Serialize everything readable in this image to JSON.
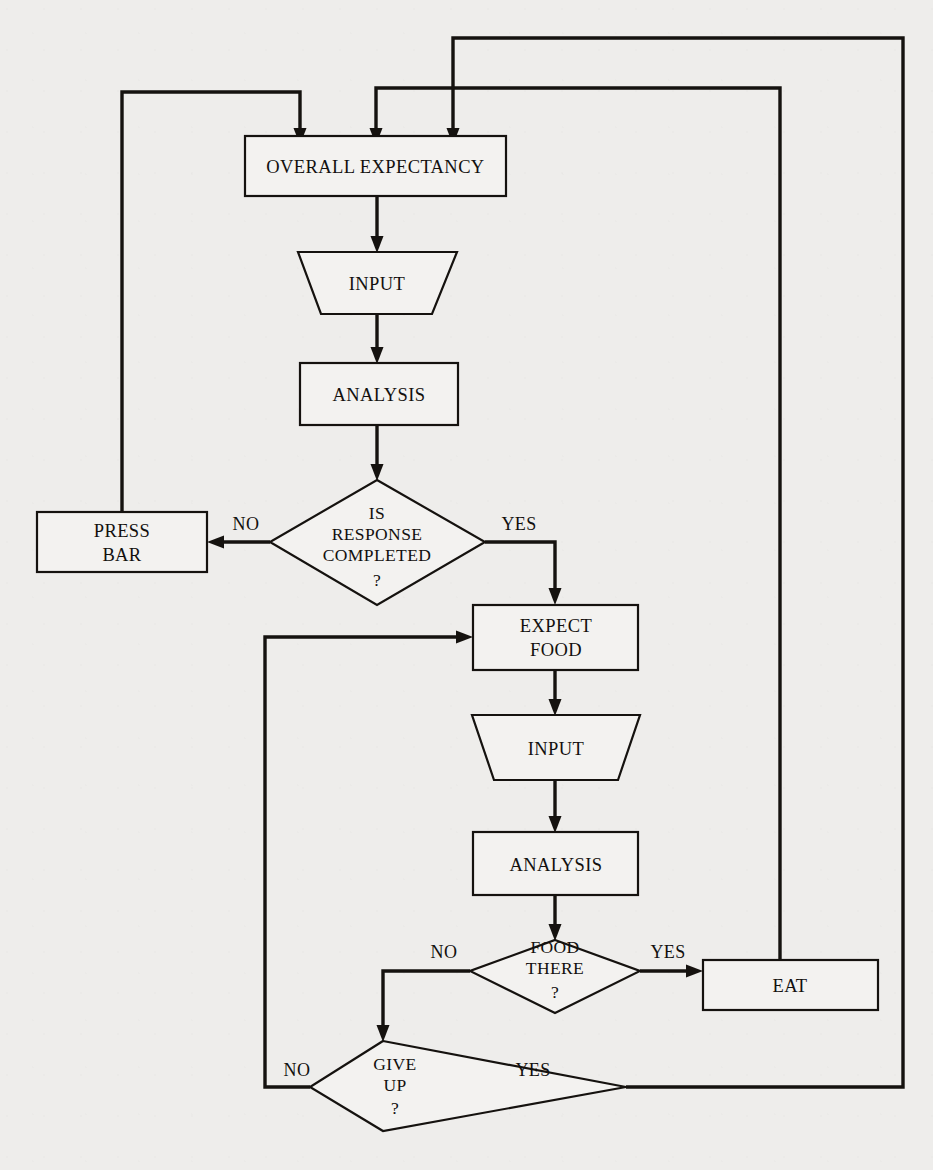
{
  "diagram": {
    "type": "flowchart",
    "background_color": "#eeedeb",
    "ink_color": "#15120f",
    "nodes": [
      {
        "id": "overall_expectancy",
        "shape": "rectangle",
        "label": "OVERALL EXPECTANCY"
      },
      {
        "id": "input_1",
        "shape": "trapezoid",
        "label": "INPUT"
      },
      {
        "id": "analysis_1",
        "shape": "rectangle",
        "label": "ANALYSIS"
      },
      {
        "id": "is_response_completed",
        "shape": "diamond",
        "label_line1": "IS",
        "label_line2": "RESPONSE",
        "label_line3": "COMPLETED",
        "label_line4": "?"
      },
      {
        "id": "press_bar",
        "shape": "rectangle",
        "label_line1": "PRESS",
        "label_line2": "BAR"
      },
      {
        "id": "expect_food",
        "shape": "rectangle",
        "label_line1": "EXPECT",
        "label_line2": "FOOD"
      },
      {
        "id": "input_2",
        "shape": "trapezoid",
        "label": "INPUT"
      },
      {
        "id": "analysis_2",
        "shape": "rectangle",
        "label": "ANALYSIS"
      },
      {
        "id": "food_there",
        "shape": "diamond",
        "label_line1": "FOOD",
        "label_line2": "THERE",
        "label_line3": "?"
      },
      {
        "id": "eat",
        "shape": "rectangle",
        "label": "EAT"
      },
      {
        "id": "give_up",
        "shape": "diamond",
        "label_line1": "GIVE",
        "label_line2": "UP",
        "label_line3": "?"
      }
    ],
    "edge_labels": {
      "response_no": "NO",
      "response_yes": "YES",
      "food_no": "NO",
      "food_yes": "YES",
      "giveup_no": "NO",
      "giveup_yes": "YES"
    },
    "edges": [
      {
        "from": "press_bar",
        "to": "overall_expectancy",
        "label": ""
      },
      {
        "from": "eat",
        "to": "overall_expectancy",
        "label": ""
      },
      {
        "from": "give_up",
        "to": "overall_expectancy",
        "label": "YES"
      },
      {
        "from": "overall_expectancy",
        "to": "input_1",
        "label": ""
      },
      {
        "from": "input_1",
        "to": "analysis_1",
        "label": ""
      },
      {
        "from": "analysis_1",
        "to": "is_response_completed",
        "label": ""
      },
      {
        "from": "is_response_completed",
        "to": "press_bar",
        "label": "NO"
      },
      {
        "from": "is_response_completed",
        "to": "expect_food",
        "label": "YES"
      },
      {
        "from": "expect_food",
        "to": "input_2",
        "label": ""
      },
      {
        "from": "input_2",
        "to": "analysis_2",
        "label": ""
      },
      {
        "from": "analysis_2",
        "to": "food_there",
        "label": ""
      },
      {
        "from": "food_there",
        "to": "eat",
        "label": "YES"
      },
      {
        "from": "food_there",
        "to": "give_up",
        "label": "NO"
      },
      {
        "from": "give_up",
        "to": "expect_food",
        "label": "NO"
      }
    ]
  }
}
